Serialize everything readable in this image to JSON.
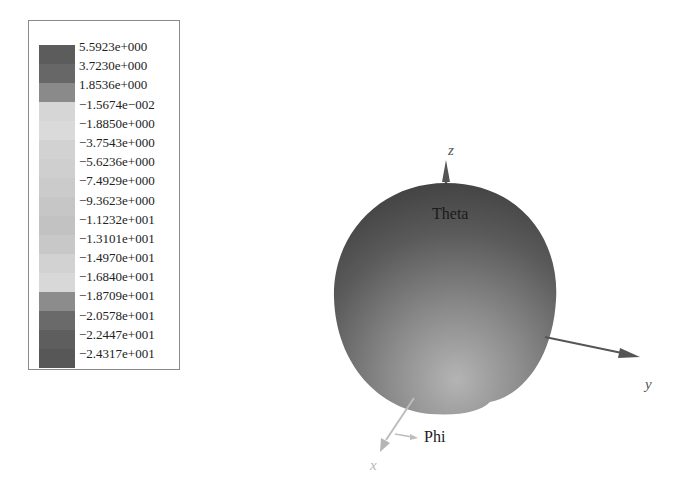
{
  "legend": {
    "title": "",
    "entries": [
      {
        "label": "5.5923e+000",
        "color": "#5c5c5c"
      },
      {
        "label": "3.7230e+000",
        "color": "#676767"
      },
      {
        "label": "1.8536e+000",
        "color": "#8a8a8a"
      },
      {
        "label": "-1.5674e-002",
        "color": "#d6d6d6"
      },
      {
        "label": "-1.8850e+000",
        "color": "#dadada"
      },
      {
        "label": "-3.7543e+000",
        "color": "#d2d2d2"
      },
      {
        "label": "-5.6236e+000",
        "color": "#cfcfcf"
      },
      {
        "label": "-7.4929e+000",
        "color": "#cbcbcb"
      },
      {
        "label": "-9.3623e+000",
        "color": "#c6c6c6"
      },
      {
        "label": "-1.1232e+001",
        "color": "#c2c2c2"
      },
      {
        "label": "-1.3101e+001",
        "color": "#c8c8c8"
      },
      {
        "label": "-1.4970e+001",
        "color": "#d2d2d2"
      },
      {
        "label": "-1.6840e+001",
        "color": "#d8d8d8"
      },
      {
        "label": "-1.8709e+001",
        "color": "#8c8c8c"
      },
      {
        "label": "-2.0578e+001",
        "color": "#6a6a6a"
      },
      {
        "label": "-2.2447e+001",
        "color": "#5e5e5e"
      },
      {
        "label": "-2.4317e+001",
        "color": "#575757"
      }
    ]
  },
  "axes": {
    "z": {
      "label": "z",
      "color": "#555555"
    },
    "y": {
      "label": "y",
      "color": "#555555"
    },
    "x": {
      "label": "x",
      "color": "#b5b5b5"
    }
  },
  "annotations": {
    "theta": "Theta",
    "phi": "Phi"
  },
  "pattern": {
    "shape": "3D radiation pattern (near-spherical)",
    "top_color": "#4e4e4e",
    "bottom_color": "#a9a9a9"
  }
}
